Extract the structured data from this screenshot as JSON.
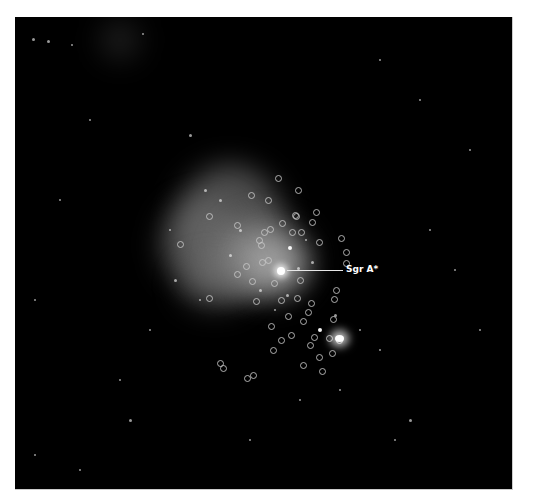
{
  "image": {
    "subject": "Galactic center X-ray image with point sources circled",
    "background_color": "#000000",
    "frame_border_color": "#ffffff"
  },
  "annotation": {
    "label": "Sgr A*",
    "label_color": "#ffffff"
  },
  "nebula": [
    {
      "x": 175,
      "y": 165,
      "w": 110,
      "h": 130,
      "c": "rgba(140,140,140,0.55)"
    },
    {
      "x": 160,
      "y": 200,
      "w": 90,
      "h": 90,
      "c": "rgba(120,120,120,0.5)"
    },
    {
      "x": 220,
      "y": 220,
      "w": 90,
      "h": 80,
      "c": "rgba(160,160,160,0.55)"
    },
    {
      "x": 245,
      "y": 240,
      "w": 60,
      "h": 50,
      "c": "rgba(200,200,200,0.55)"
    },
    {
      "x": 180,
      "y": 260,
      "w": 70,
      "h": 50,
      "c": "rgba(110,110,110,0.45)"
    },
    {
      "x": 100,
      "y": 20,
      "w": 40,
      "h": 40,
      "c": "rgba(80,80,80,0.35)"
    }
  ],
  "stars": [
    [
      318,
      15,
      2
    ],
    [
      33,
      39,
      1.5
    ],
    [
      48,
      41,
      1.5
    ],
    [
      143,
      34,
      1
    ],
    [
      72,
      45,
      1
    ],
    [
      90,
      120,
      1
    ],
    [
      60,
      200,
      1
    ],
    [
      35,
      300,
      1
    ],
    [
      120,
      380,
      1
    ],
    [
      130,
      420,
      1.5
    ],
    [
      35,
      455,
      1
    ],
    [
      80,
      470,
      1
    ],
    [
      200,
      300,
      1
    ],
    [
      380,
      60,
      1
    ],
    [
      420,
      100,
      1
    ],
    [
      470,
      150,
      1
    ],
    [
      455,
      270,
      1
    ],
    [
      480,
      330,
      1
    ],
    [
      395,
      440,
      1
    ],
    [
      380,
      350,
      1
    ],
    [
      410,
      420,
      1.5
    ],
    [
      430,
      230,
      1
    ],
    [
      300,
      400,
      1
    ],
    [
      250,
      440,
      1
    ],
    [
      150,
      330,
      1
    ],
    [
      190,
      135,
      1.5
    ],
    [
      205,
      190,
      1.5
    ],
    [
      240,
      230,
      1.5
    ],
    [
      290,
      248,
      2
    ],
    [
      298,
      268,
      1.5
    ],
    [
      306,
      240,
      1
    ],
    [
      312,
      262,
      1.5
    ],
    [
      260,
      290,
      1.5
    ],
    [
      320,
      330,
      2
    ],
    [
      335,
      315,
      1.5
    ],
    [
      360,
      330,
      1
    ],
    [
      170,
      230,
      1
    ],
    [
      175,
      280,
      1.5
    ],
    [
      220,
      200,
      1.5
    ],
    [
      230,
      255,
      1.5
    ],
    [
      275,
      310,
      1
    ],
    [
      287,
      295,
      1.5
    ],
    [
      340,
      390,
      1
    ]
  ],
  "rings": [
    [
      278,
      178
    ],
    [
      298,
      190
    ],
    [
      251,
      195
    ],
    [
      237,
      225
    ],
    [
      209,
      216
    ],
    [
      180,
      244
    ],
    [
      268,
      200
    ],
    [
      295,
      215
    ],
    [
      292,
      232
    ],
    [
      316,
      212
    ],
    [
      312,
      222
    ],
    [
      296,
      216
    ],
    [
      282,
      223
    ],
    [
      259,
      240
    ],
    [
      270,
      229
    ],
    [
      261,
      245
    ],
    [
      268,
      260
    ],
    [
      246,
      266
    ],
    [
      252,
      281
    ],
    [
      237,
      274
    ],
    [
      301,
      232
    ],
    [
      319,
      242
    ],
    [
      341,
      238
    ],
    [
      346,
      252
    ],
    [
      346,
      263
    ],
    [
      300,
      280
    ],
    [
      274,
      283
    ],
    [
      256,
      301
    ],
    [
      281,
      300
    ],
    [
      297,
      298
    ],
    [
      308,
      312
    ],
    [
      288,
      316
    ],
    [
      303,
      321
    ],
    [
      334,
      299
    ],
    [
      336,
      290
    ],
    [
      329,
      338
    ],
    [
      333,
      319
    ],
    [
      271,
      326
    ],
    [
      291,
      335
    ],
    [
      314,
      337
    ],
    [
      310,
      345
    ],
    [
      281,
      340
    ],
    [
      319,
      357
    ],
    [
      303,
      365
    ],
    [
      332,
      353
    ],
    [
      339,
      340
    ],
    [
      223,
      368
    ],
    [
      322,
      371
    ],
    [
      220,
      363
    ],
    [
      247,
      378
    ],
    [
      209,
      298
    ],
    [
      253,
      375
    ],
    [
      273,
      350
    ],
    [
      311,
      303
    ],
    [
      262,
      262
    ],
    [
      264,
      232
    ]
  ]
}
